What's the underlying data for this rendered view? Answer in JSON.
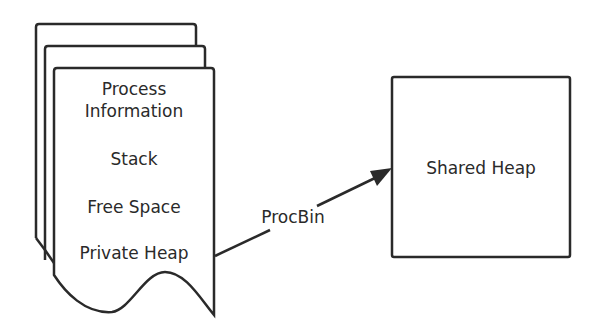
{
  "diagram": {
    "process_stack": {
      "sections": [
        {
          "label_line1": "Process",
          "label_line2": "Information"
        },
        {
          "label": "Stack"
        },
        {
          "label": "Free Space"
        },
        {
          "label": "Private Heap"
        }
      ]
    },
    "arrow": {
      "label": "ProcBin"
    },
    "shared_heap": {
      "label": "Shared Heap"
    },
    "colors": {
      "stroke": "#2a2a2a",
      "background": "#ffffff"
    }
  }
}
